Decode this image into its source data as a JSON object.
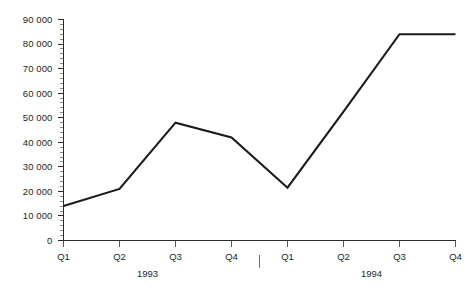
{
  "chart_data": {
    "type": "line",
    "title": "",
    "xlabel": "",
    "ylabel": "",
    "ylim": [
      0,
      90000
    ],
    "ytick_step": 10000,
    "yminor_step": 2000,
    "grid": false,
    "legend": "none",
    "categories": [
      "Q1",
      "Q2",
      "Q3",
      "Q4",
      "Q1",
      "Q2",
      "Q3",
      "Q4"
    ],
    "x_group_labels": [
      "1993",
      "1994"
    ],
    "x_group_separator": true,
    "series": [
      {
        "name": "series-1",
        "color": "#1a1a1a",
        "values": [
          14000,
          21000,
          48000,
          42000,
          21500,
          52500,
          84000,
          84000
        ]
      }
    ],
    "ytick_labels": [
      "0",
      "10 000",
      "20 000",
      "30 000",
      "40 000",
      "50 000",
      "60 000",
      "70 000",
      "80 000",
      "90 000"
    ],
    "points": [
      {
        "x": "Q1",
        "year": "1993",
        "y": 14000
      },
      {
        "x": "Q2",
        "year": "1993",
        "y": 21000
      },
      {
        "x": "Q3",
        "year": "1993",
        "y": 48000
      },
      {
        "x": "Q4",
        "year": "1993",
        "y": 42000
      },
      {
        "x": "Q1",
        "year": "1994",
        "y": 21500
      },
      {
        "x": "Q2",
        "year": "1994",
        "y": 52500
      },
      {
        "x": "Q3",
        "year": "1994",
        "y": 84000
      },
      {
        "x": "Q4",
        "year": "1994",
        "y": 84000
      }
    ]
  },
  "colors": {
    "series": "#1a1a1a",
    "axis": "#2b2b2b",
    "tick_minor": "#6f6f6f",
    "text": "#231f20",
    "background": "#ffffff"
  }
}
